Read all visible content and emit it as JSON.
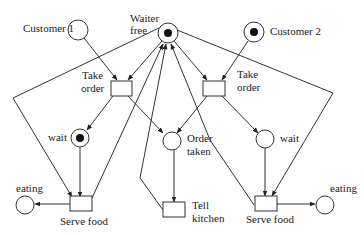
{
  "diagram": {
    "type": "petri-net",
    "places": [
      {
        "id": "customer1",
        "label": "Customer 1",
        "token": false
      },
      {
        "id": "waiter_free",
        "label_lines": [
          "Waiter",
          "free"
        ],
        "token": true
      },
      {
        "id": "customer2",
        "label": "Customer 2",
        "token": true
      },
      {
        "id": "wait1",
        "label": "wait",
        "token": true
      },
      {
        "id": "order_taken",
        "label_lines": [
          "Order",
          "taken"
        ],
        "token": false
      },
      {
        "id": "wait2",
        "label": "wait",
        "token": false
      },
      {
        "id": "eating1",
        "label": "eating",
        "token": false
      },
      {
        "id": "eating2",
        "label": "eating",
        "token": false
      }
    ],
    "transitions": [
      {
        "id": "take_order1",
        "label_lines": [
          "Take",
          "order"
        ]
      },
      {
        "id": "take_order2",
        "label_lines": [
          "Take",
          "order"
        ]
      },
      {
        "id": "serve_food1",
        "label": "Serve food"
      },
      {
        "id": "tell_kitchen",
        "label_lines": [
          "Tell",
          "kitchen"
        ]
      },
      {
        "id": "serve_food2",
        "label": "Serve food"
      }
    ],
    "arcs": [
      [
        "customer1",
        "take_order1"
      ],
      [
        "waiter_free",
        "take_order1"
      ],
      [
        "customer2",
        "take_order2"
      ],
      [
        "waiter_free",
        "take_order2"
      ],
      [
        "take_order1",
        "wait1"
      ],
      [
        "take_order1",
        "order_taken"
      ],
      [
        "take_order1",
        "waiter_free"
      ],
      [
        "take_order2",
        "order_taken"
      ],
      [
        "take_order2",
        "wait2"
      ],
      [
        "take_order2",
        "waiter_free"
      ],
      [
        "order_taken",
        "tell_kitchen"
      ],
      [
        "tell_kitchen",
        "waiter_free"
      ],
      [
        "wait1",
        "serve_food1"
      ],
      [
        "waiter_free",
        "serve_food1"
      ],
      [
        "serve_food1",
        "waiter_free"
      ],
      [
        "serve_food1",
        "eating1"
      ],
      [
        "wait2",
        "serve_food2"
      ],
      [
        "waiter_free",
        "serve_food2"
      ],
      [
        "serve_food2",
        "waiter_free"
      ],
      [
        "serve_food2",
        "eating2"
      ]
    ]
  },
  "labels": {
    "customer1": "Customer 1",
    "customer2": "Customer 2",
    "waiter_line1": "Waiter",
    "waiter_line2": "free",
    "take_order1_line1": "Take",
    "take_order1_line2": "order",
    "take_order2_line1": "Take",
    "take_order2_line2": "order",
    "wait1": "wait",
    "wait2": "wait",
    "order_taken_line1": "Order",
    "order_taken_line2": "taken",
    "eating1": "eating",
    "eating2": "eating",
    "serve_food1": "Serve food",
    "serve_food2": "Serve food",
    "tell_kitchen_line1": "Tell",
    "tell_kitchen_line2": "kitchen"
  }
}
